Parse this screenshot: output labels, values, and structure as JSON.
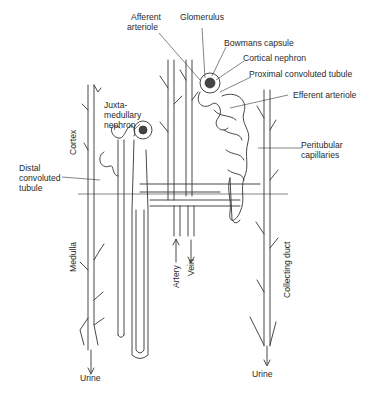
{
  "diagram": {
    "title": "",
    "labels": {
      "afferent_arteriole_1": "Afferent",
      "afferent_arteriole_2": "arteriole",
      "glomerulus": "Glomerulus",
      "bowmans_capsule": "Bowmans capsule",
      "cortical_nephron": "Cortical nephron",
      "proximal_convoluted_tubule": "Proximal convoluted tubule",
      "efferent_arteriole": "Efferent arteriole",
      "juxta_1": "Juxta-",
      "juxta_2": "medullary",
      "juxta_3": "nephron",
      "peritubular_1": "Peritubular",
      "peritubular_2": "capillaries",
      "distal_1": "Distal",
      "distal_2": "convoluted",
      "distal_3": "tubule",
      "cortex": "Cortex",
      "medulla": "Medulla",
      "artery": "Artery",
      "vein": "Vein",
      "collecting_duct": "Collecting duct",
      "urine_left": "Urine",
      "urine_right": "Urine"
    },
    "regions": [
      "Cortex",
      "Medulla"
    ],
    "flow_arrows": [
      {
        "label": "Artery",
        "direction": "up"
      },
      {
        "label": "Vein",
        "direction": "down"
      },
      {
        "label": "Urine",
        "direction": "down",
        "position": "left"
      },
      {
        "label": "Urine",
        "direction": "down",
        "position": "right"
      }
    ],
    "colors": {
      "line": "#333333",
      "background": "#ffffff",
      "text": "#2a2a2a"
    }
  }
}
